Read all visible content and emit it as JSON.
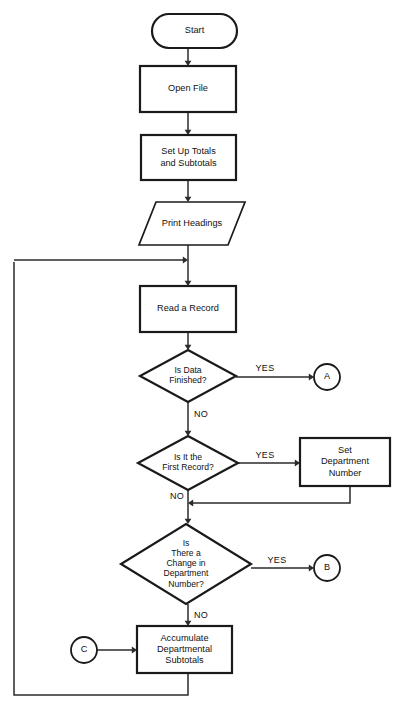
{
  "diagram": {
    "type": "flowchart",
    "background_color": "#ffffff",
    "line_color": "#2b2b2b",
    "shape_stroke_color": "#1a1a1a",
    "text_color": "#111111"
  },
  "nodes": [
    {
      "id": "start",
      "shape": "terminator",
      "lines": [
        "Start"
      ],
      "x": 152,
      "y": 14,
      "w": 85,
      "h": 34
    },
    {
      "id": "open-file",
      "shape": "process",
      "lines": [
        "Open File"
      ],
      "x": 140,
      "y": 66,
      "w": 96,
      "h": 46
    },
    {
      "id": "set-up-totals",
      "shape": "process",
      "lines": [
        "Set Up Totals",
        "and Subtotals"
      ],
      "x": 141,
      "y": 135,
      "w": 95,
      "h": 45
    },
    {
      "id": "print-headings",
      "shape": "io-parallelogram",
      "lines": [
        "Print Headings"
      ],
      "x": 139,
      "y": 202,
      "w": 106,
      "h": 43
    },
    {
      "id": "read-a-record",
      "shape": "process",
      "lines": [
        "Read a Record"
      ],
      "x": 140,
      "y": 286,
      "w": 96,
      "h": 46
    },
    {
      "id": "is-data-finished",
      "shape": "decision",
      "lines": [
        "Is Data",
        "Finished?"
      ],
      "x": 140,
      "y": 350,
      "w": 96,
      "h": 52
    },
    {
      "id": "is-it-first-record",
      "shape": "decision",
      "lines": [
        "Is It the",
        "First Record?"
      ],
      "x": 138,
      "y": 436,
      "w": 100,
      "h": 54
    },
    {
      "id": "set-department-number",
      "shape": "process",
      "lines": [
        "Set",
        "Department",
        "Number"
      ],
      "x": 300,
      "y": 438,
      "w": 90,
      "h": 48
    },
    {
      "id": "is-there-a-change",
      "shape": "decision",
      "lines": [
        "Is",
        "There a",
        "Change in",
        "Department",
        "Number?"
      ],
      "x": 121,
      "y": 524,
      "w": 130,
      "h": 80
    },
    {
      "id": "accumulate-subtotals",
      "shape": "process",
      "lines": [
        "Accumulate",
        "Departmental",
        "Subtotals"
      ],
      "x": 137,
      "y": 626,
      "w": 95,
      "h": 47
    }
  ],
  "connectors": [
    {
      "id": "connector-a",
      "label": "A",
      "cx": 327,
      "cy": 377,
      "r": 13
    },
    {
      "id": "connector-b",
      "label": "B",
      "cx": 327,
      "cy": 568,
      "r": 13
    },
    {
      "id": "connector-c",
      "label": "C",
      "cx": 84,
      "cy": 650,
      "r": 13
    }
  ],
  "branch_labels": [
    {
      "id": "yes-data-finished",
      "text": "YES",
      "x": 265,
      "y": 369
    },
    {
      "id": "no-data-finished",
      "text": "NO",
      "x": 201,
      "y": 415
    },
    {
      "id": "yes-first-record",
      "text": "YES",
      "x": 265,
      "y": 456
    },
    {
      "id": "no-first-record",
      "text": "NO",
      "x": 177,
      "y": 497
    },
    {
      "id": "yes-change-dept",
      "text": "YES",
      "x": 277,
      "y": 561
    },
    {
      "id": "no-change-dept",
      "text": "NO",
      "x": 201,
      "y": 616
    }
  ],
  "edges": [
    {
      "id": "edge-start-to-open-file",
      "path": "M 188 48 L 188 64",
      "arrow": "down",
      "arrow_at": [
        188,
        66
      ]
    },
    {
      "id": "edge-open-file-to-set-up-totals",
      "path": "M 188 112 L 188 133",
      "arrow": "down",
      "arrow_at": [
        188,
        135
      ]
    },
    {
      "id": "edge-set-up-totals-to-print-headings",
      "path": "M 188 180 L 188 200",
      "arrow": "down",
      "arrow_at": [
        188,
        202
      ]
    },
    {
      "id": "edge-print-headings-to-junction",
      "path": "M 188 245 L 188 284",
      "arrow": "down",
      "arrow_at": [
        188,
        286
      ]
    },
    {
      "id": "edge-loop-return-into-main",
      "path": "M 14 260 L 185 260",
      "arrow": "right",
      "arrow_at": [
        188,
        260
      ]
    },
    {
      "id": "edge-read-record-to-decision",
      "path": "M 188 332 L 188 348",
      "arrow": "down",
      "arrow_at": [
        188,
        350
      ]
    },
    {
      "id": "edge-data-finished-yes-to-a",
      "path": "M 236 377 L 311 377",
      "arrow": "right",
      "arrow_at": [
        314,
        377
      ]
    },
    {
      "id": "edge-data-finished-no-down",
      "path": "M 188 402 L 188 434",
      "arrow": "down",
      "arrow_at": [
        188,
        436
      ]
    },
    {
      "id": "edge-first-record-yes-to-set-dept",
      "path": "M 238 463 L 297 463",
      "arrow": "right",
      "arrow_at": [
        300,
        463
      ]
    },
    {
      "id": "edge-set-dept-merge-back",
      "path": "M 350 486 L 350 503 L 191 503",
      "arrow": "left",
      "arrow_at": [
        188,
        503
      ]
    },
    {
      "id": "edge-first-record-no-down",
      "path": "M 188 490 L 188 522",
      "arrow": "down",
      "arrow_at": [
        188,
        524
      ]
    },
    {
      "id": "edge-change-dept-yes-to-b",
      "path": "M 251 568 L 311 568",
      "arrow": "right",
      "arrow_at": [
        314,
        568
      ]
    },
    {
      "id": "edge-change-dept-no-down",
      "path": "M 188 604 L 188 624",
      "arrow": "down",
      "arrow_at": [
        188,
        626
      ]
    },
    {
      "id": "edge-c-to-accumulate",
      "path": "M 97 650 L 134 650",
      "arrow": "right",
      "arrow_at": [
        137,
        650
      ]
    },
    {
      "id": "edge-accumulate-loop-back",
      "path": "M 188 673 L 188 695 L 14 695 L 14 262",
      "arrow": "none",
      "arrow_at": null
    }
  ]
}
